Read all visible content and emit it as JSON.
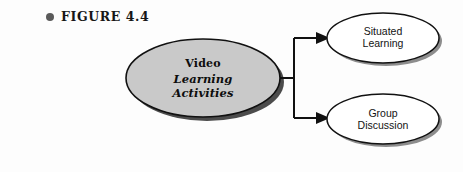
{
  "figure": {
    "bullet_icon": "bullet-dot-icon",
    "caption": "FIGURE 4.4"
  },
  "diagram": {
    "type": "flow-diagram",
    "orientation": "left-to-right",
    "nodes": [
      {
        "id": "main",
        "shape": "ellipse",
        "fill_color": "#c9c9c9",
        "stroke_color": "#111111",
        "shadow": true,
        "label_primary": "Video",
        "label_secondary_line1": "Learning",
        "label_secondary_line2": "Activities"
      },
      {
        "id": "leaf-1",
        "shape": "ellipse",
        "fill_color": "#ffffff",
        "stroke_color": "#111111",
        "shadow": true,
        "label_line1": "Situated",
        "label_line2": "Learning"
      },
      {
        "id": "leaf-2",
        "shape": "ellipse",
        "fill_color": "#ffffff",
        "stroke_color": "#111111",
        "shadow": true,
        "label_line1": "Group",
        "label_line2": "Discussion"
      }
    ],
    "connectors": [
      {
        "id": "trunk",
        "from": "main",
        "style": "solid",
        "arrow": false
      },
      {
        "id": "branch-up",
        "from": "main",
        "to": "leaf-1",
        "style": "solid",
        "arrow": true
      },
      {
        "id": "branch-down",
        "from": "main",
        "to": "leaf-2",
        "style": "solid",
        "arrow": true
      }
    ]
  },
  "colors": {
    "background": "#fdfdfd",
    "line": "#111111",
    "main_fill": "#c9c9c9",
    "shadow": "#4a4a4a",
    "bullet": "#5a5a5a"
  }
}
